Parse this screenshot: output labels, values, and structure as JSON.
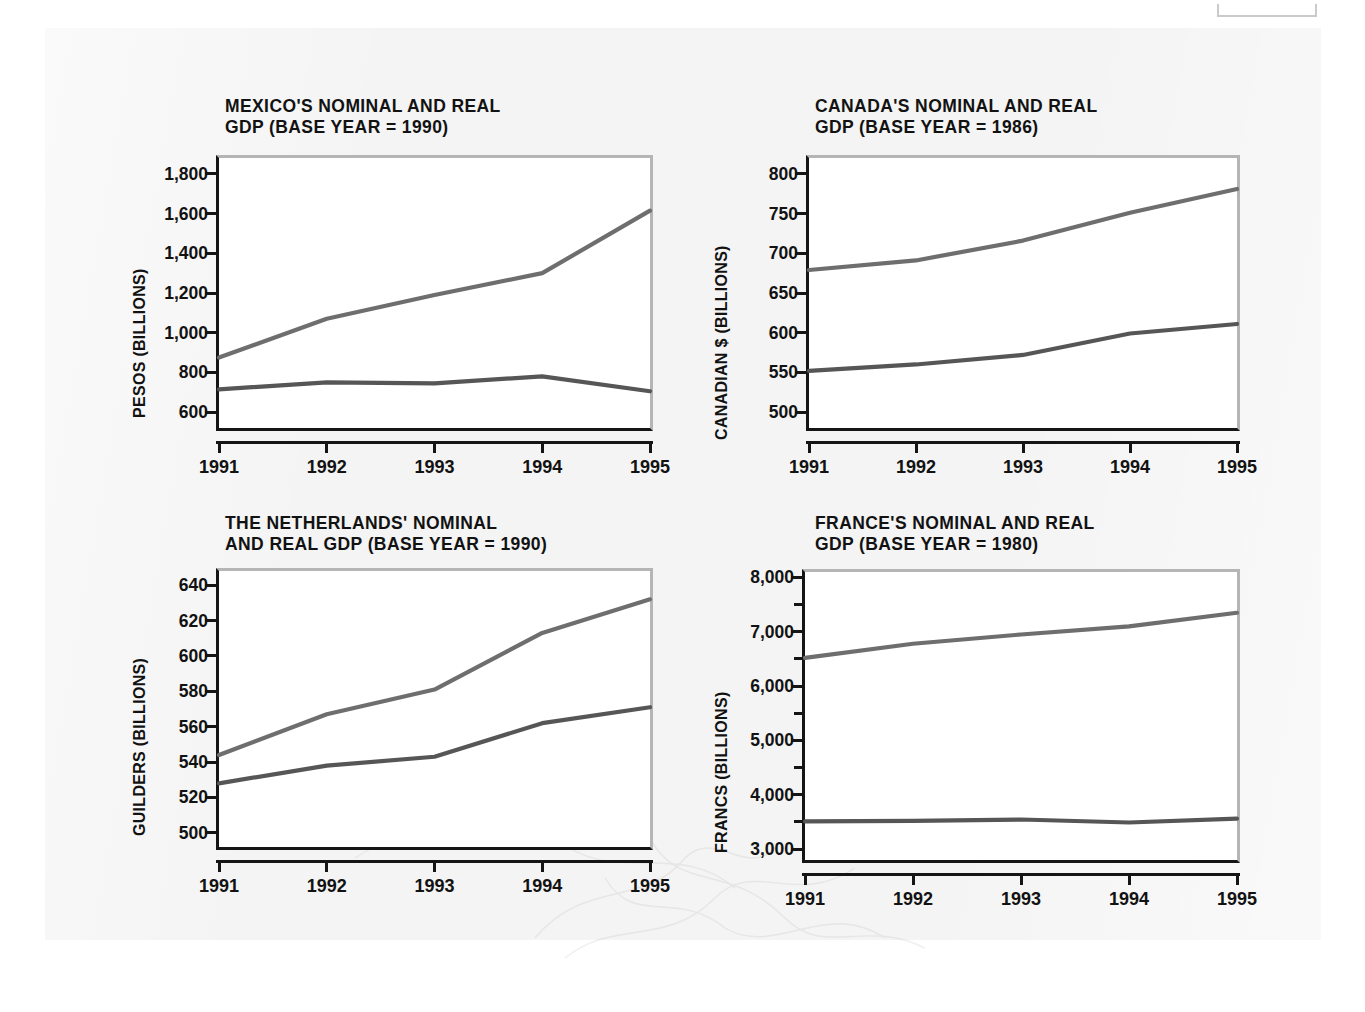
{
  "page": {
    "background_color": "#f4f4f4",
    "series_names": [
      "Nominal GDP",
      "Real GDP"
    ],
    "nominal_color": "#6e6e6e",
    "real_color": "#565656"
  },
  "chart_data": [
    {
      "id": "mexico",
      "type": "line",
      "title": "MEXICO'S NOMINAL AND REAL\nGDP (BASE YEAR = 1990)",
      "xlabel": "",
      "ylabel": "PESOS (BILLIONS)",
      "categories": [
        "1991",
        "1992",
        "1993",
        "1994",
        "1995"
      ],
      "ylim": [
        520,
        1880
      ],
      "yticks": [
        600,
        800,
        1000,
        1200,
        1400,
        1600,
        1800
      ],
      "ytick_labels": [
        "600",
        "800",
        "1,000",
        "1,200",
        "1,400",
        "1,600",
        "1,800"
      ],
      "yminor_ticks": [],
      "grid": false,
      "legend": "none",
      "series": [
        {
          "name": "Nominal GDP",
          "values": [
            875,
            1070,
            1190,
            1300,
            1615
          ]
        },
        {
          "name": "Real GDP",
          "values": [
            715,
            750,
            745,
            780,
            705
          ]
        }
      ]
    },
    {
      "id": "canada",
      "type": "line",
      "title": "CANADA'S NOMINAL AND REAL\nGDP (BASE YEAR = 1986)",
      "xlabel": "",
      "ylabel": "CANADIAN $ (BILLIONS)",
      "categories": [
        "1991",
        "1992",
        "1993",
        "1994",
        "1995"
      ],
      "ylim": [
        480,
        820
      ],
      "yticks": [
        500,
        550,
        600,
        650,
        700,
        750,
        800
      ],
      "ytick_labels": [
        "500",
        "550",
        "600",
        "650",
        "700",
        "750",
        "800"
      ],
      "yminor_ticks": [],
      "grid": false,
      "legend": "none",
      "series": [
        {
          "name": "Nominal GDP",
          "values": [
            679,
            691,
            716,
            751,
            781
          ]
        },
        {
          "name": "Real GDP",
          "values": [
            552,
            560,
            572,
            599,
            611
          ]
        }
      ]
    },
    {
      "id": "netherlands",
      "type": "line",
      "title": "THE NETHERLANDS' NOMINAL\nAND REAL GDP (BASE YEAR = 1990)",
      "xlabel": "",
      "ylabel": "GUILDERS (BILLIONS)",
      "categories": [
        "1991",
        "1992",
        "1993",
        "1994",
        "1995"
      ],
      "ylim": [
        492,
        648
      ],
      "yticks": [
        500,
        520,
        540,
        560,
        580,
        600,
        620,
        640
      ],
      "ytick_labels": [
        "500",
        "520",
        "540",
        "560",
        "580",
        "600",
        "620",
        "640"
      ],
      "yminor_ticks": [],
      "grid": false,
      "legend": "none",
      "series": [
        {
          "name": "Nominal GDP",
          "values": [
            544,
            567,
            581,
            613,
            632
          ]
        },
        {
          "name": "Real GDP",
          "values": [
            528,
            538,
            543,
            562,
            571
          ]
        }
      ]
    },
    {
      "id": "france",
      "type": "line",
      "title": "FRANCE'S NOMINAL AND REAL\nGDP (BASE YEAR = 1980)",
      "xlabel": "",
      "ylabel": "FRANCS (BILLIONS)",
      "categories": [
        "1991",
        "1992",
        "1993",
        "1994",
        "1995"
      ],
      "ylim": [
        2800,
        8100
      ],
      "yticks": [
        3000,
        4000,
        5000,
        6000,
        7000,
        8000
      ],
      "ytick_labels": [
        "3,000",
        "4,000",
        "5,000",
        "6,000",
        "7,000",
        "8,000"
      ],
      "yminor_ticks": [
        3500,
        4500,
        5500,
        6500,
        7500
      ],
      "grid": false,
      "legend": "none",
      "series": [
        {
          "name": "Nominal GDP",
          "values": [
            6520,
            6780,
            6950,
            7100,
            7350
          ]
        },
        {
          "name": "Real GDP",
          "values": [
            3510,
            3520,
            3545,
            3490,
            3560
          ]
        }
      ]
    }
  ]
}
